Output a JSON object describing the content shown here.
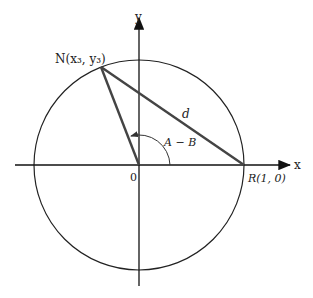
{
  "diagram": {
    "axes": {
      "x_label": "x",
      "y_label": "y",
      "origin_label": "0"
    },
    "points": {
      "N": {
        "label": "N(x₃, y₃)"
      },
      "R": {
        "label": "R(1, 0)"
      }
    },
    "segment_label": "d",
    "angle_label": "A − B",
    "colors": {
      "axis": "#111111",
      "circle": "#222222",
      "triangle": "#444444"
    }
  }
}
